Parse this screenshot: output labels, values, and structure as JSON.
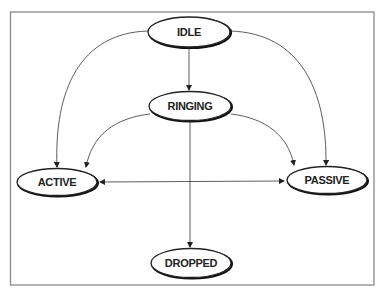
{
  "diagram": {
    "type": "state-diagram",
    "nodes": [
      {
        "id": "idle",
        "label": "IDLE",
        "cx": 189,
        "cy": 32,
        "rx": 41,
        "ry": 15
      },
      {
        "id": "ringing",
        "label": "RINGING",
        "cx": 190,
        "cy": 106,
        "rx": 41,
        "ry": 14.5
      },
      {
        "id": "active",
        "label": "ACTIVE",
        "cx": 57,
        "cy": 182,
        "rx": 40,
        "ry": 13.5
      },
      {
        "id": "passive",
        "label": "PASSIVE",
        "cx": 327,
        "cy": 180,
        "rx": 40,
        "ry": 13.5
      },
      {
        "id": "dropped",
        "label": "DROPPED",
        "cx": 191,
        "cy": 263,
        "rx": 40,
        "ry": 14.5
      }
    ],
    "edges": [
      {
        "from": "IDLE",
        "to": "RINGING",
        "direction": "one-way"
      },
      {
        "from": "IDLE",
        "to": "ACTIVE",
        "direction": "one-way"
      },
      {
        "from": "IDLE",
        "to": "PASSIVE",
        "direction": "one-way"
      },
      {
        "from": "RINGING",
        "to": "ACTIVE",
        "direction": "one-way"
      },
      {
        "from": "RINGING",
        "to": "PASSIVE",
        "direction": "one-way"
      },
      {
        "from": "RINGING",
        "to": "DROPPED",
        "direction": "one-way"
      },
      {
        "from": "ACTIVE",
        "to": "PASSIVE",
        "direction": "bidirectional"
      }
    ]
  }
}
